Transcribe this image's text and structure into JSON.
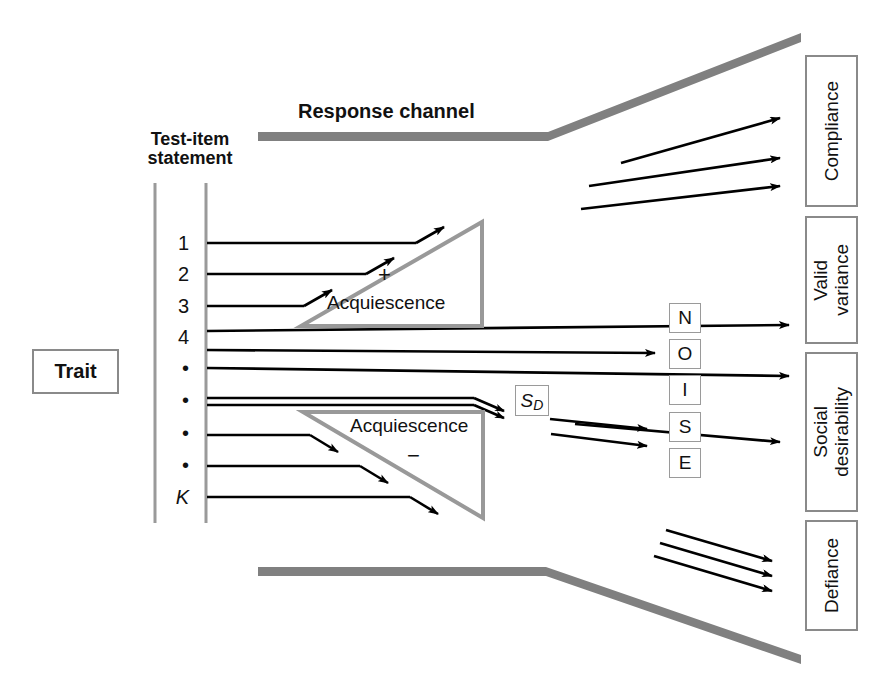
{
  "figure": {
    "headings": {
      "response_channel": "Response channel",
      "test_item_line1": "Test-item",
      "test_item_line2": "statement"
    },
    "trait_box": {
      "label": "Trait"
    },
    "item_labels": [
      "1",
      "2",
      "3",
      "4",
      "•",
      "•",
      "•",
      "•",
      "K"
    ],
    "triangles": [
      {
        "name": "acquiescence-positive",
        "label": "Acquiescence",
        "sign": "+",
        "sign_position": "above"
      },
      {
        "name": "acquiescence-negative",
        "label": "Acquiescence",
        "sign": "−",
        "sign_position": "below"
      }
    ],
    "sd_marker": {
      "main": "S",
      "sub": "D"
    },
    "noise_letters": [
      "N",
      "O",
      "I",
      "S",
      "E"
    ],
    "outcome_boxes": [
      {
        "name": "compliance",
        "label": "Compliance"
      },
      {
        "name": "valid-variance",
        "label": "Valid\nvariance",
        "line1": "Valid",
        "line2": "variance"
      },
      {
        "name": "social-desirability",
        "label": "Social\ndesirability",
        "line1": "Social",
        "line2": "desirability"
      },
      {
        "name": "defiance",
        "label": "Defiance"
      }
    ],
    "colors": {
      "channel_gray": "#808080",
      "triangle_gray": "#999999",
      "box_border_gray": "#8a8a8a",
      "line_black": "#000000",
      "axis_gray": "#9a9a9a",
      "background": "#ffffff"
    },
    "counts": {
      "compliance_arrows": 3,
      "defiance_arrows": 3,
      "acq_plus_arrows": 3,
      "acq_minus_arrows": 3,
      "sd_arrows": 2,
      "noise_arrows": 3
    }
  }
}
